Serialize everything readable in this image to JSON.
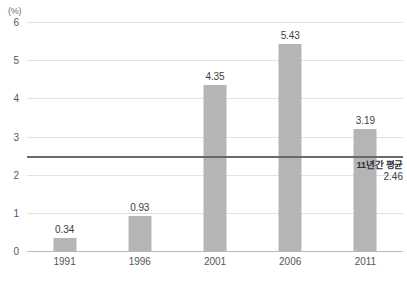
{
  "chart_data": {
    "type": "bar",
    "title": "",
    "unit_label": "(%)",
    "xlabel": "",
    "ylabel": "",
    "categories": [
      "1991",
      "1996",
      "2001",
      "2006",
      "2011"
    ],
    "values": [
      0.34,
      0.93,
      4.35,
      5.43,
      3.19
    ],
    "value_labels": [
      "0.34",
      "0.93",
      "4.35",
      "5.43",
      "3.19"
    ],
    "ylim": [
      0,
      6
    ],
    "yticks": [
      0,
      1,
      2,
      3,
      4,
      5,
      6
    ],
    "ytick_labels": [
      "0",
      "1",
      "2",
      "3",
      "4",
      "5",
      "6"
    ],
    "grid": true,
    "legend": "none",
    "bar_color": "#b5b5b5",
    "gridline_color": "#e2e2e2",
    "baseline_color": "#b8b8b8",
    "annotations": [
      {
        "type": "hline",
        "value": 2.46,
        "label": "11년간 평균",
        "value_label": "2.46",
        "color": "#6a6a6a"
      }
    ]
  }
}
